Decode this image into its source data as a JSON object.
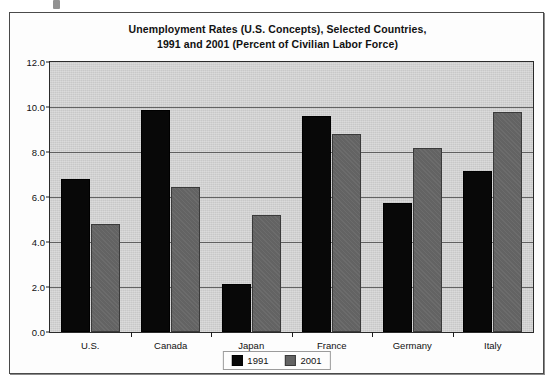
{
  "chart_data": {
    "type": "bar",
    "title": "Unemployment Rates (U.S. Concepts), Selected Countries, 1991 and 2001 (Percent of Civilian Labor Force)",
    "title_lines": [
      "Unemployment Rates (U.S. Concepts), Selected Countries,",
      "1991 and 2001 (Percent of Civilian Labor Force)"
    ],
    "xlabel": "",
    "ylabel": "",
    "ylim": [
      0.0,
      12.0
    ],
    "ytick_step": 2.0,
    "ytick_labels": [
      "0.0",
      "2.0",
      "4.0",
      "6.0",
      "8.0",
      "10.0",
      "12.0"
    ],
    "ytick_values": [
      0.0,
      2.0,
      4.0,
      6.0,
      8.0,
      10.0,
      12.0
    ],
    "grid": true,
    "grid_axis": "y",
    "legend_position": "bottom-center",
    "categories": [
      "U.S.",
      "Canada",
      "Japan",
      "France",
      "Germany",
      "Italy"
    ],
    "series": [
      {
        "name": "1991",
        "color": "#080808",
        "values": [
          6.8,
          9.85,
          2.15,
          9.6,
          5.75,
          7.15
        ]
      },
      {
        "name": "2001",
        "color": "#636363",
        "values": [
          4.8,
          6.45,
          5.2,
          8.8,
          8.2,
          9.8
        ]
      }
    ]
  },
  "legend": {
    "entries": [
      {
        "label": "1991",
        "color": "#080808"
      },
      {
        "label": "2001",
        "color": "#636363"
      }
    ]
  },
  "colors": {
    "plot_background": "#c8c8c8",
    "frame_background": "#fdfdfd",
    "axis": "#1c1c1c",
    "gridline": "#4e4e4e",
    "series_1991": "#080808",
    "series_2001": "#636363"
  }
}
